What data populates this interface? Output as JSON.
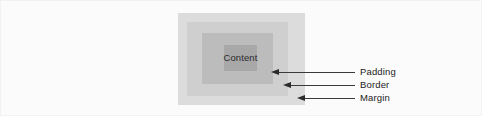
{
  "figure": {
    "background_color": "#fbfbfb",
    "frame_color": "#f2f2f2"
  },
  "box_model": {
    "layers": [
      {
        "name": "margin",
        "label": "Margin",
        "color": "#dcdcdc"
      },
      {
        "name": "border",
        "label": "Border",
        "color": "#cfcfcf"
      },
      {
        "name": "padding",
        "label": "Padding",
        "color": "#bcbcbc"
      },
      {
        "name": "content",
        "label": "Content",
        "color": "#a8a8a8"
      }
    ],
    "content_label": "Content"
  },
  "callouts": [
    {
      "name": "padding-callout",
      "label": "Padding",
      "points_to": "padding"
    },
    {
      "name": "border-callout",
      "label": "Border",
      "points_to": "border"
    },
    {
      "name": "margin-callout",
      "label": "Margin",
      "points_to": "margin"
    }
  ],
  "arrow_color": "#2b2b2b",
  "text_color": "#1c1c1c"
}
